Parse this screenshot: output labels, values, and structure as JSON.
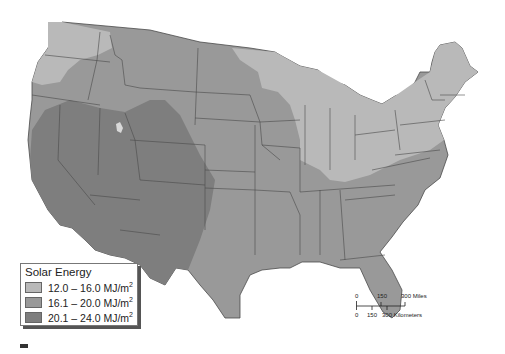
{
  "map": {
    "title": "Solar Energy in the Contiguous United States",
    "region": "Contiguous United States",
    "colors": {
      "low": "#b9b9b9",
      "mid": "#999999",
      "high": "#7e7e7e",
      "borders": "#4a4a4a",
      "water": "#ffffff"
    }
  },
  "legend": {
    "title": "Solar Energy",
    "items": [
      {
        "range": "12.0 – 16.0 MJ/m",
        "sup": "2",
        "color": "#b9b9b9"
      },
      {
        "range": "16.1 – 20.0 MJ/m",
        "sup": "2",
        "color": "#999999"
      },
      {
        "range": "20.1 – 24.0 MJ/m",
        "sup": "2",
        "color": "#7e7e7e"
      }
    ]
  },
  "scale_bar": {
    "miles_ticks": [
      "0",
      "150",
      "300 Miles"
    ],
    "km_ticks": [
      "0",
      "150",
      "300 Kilometers"
    ]
  }
}
